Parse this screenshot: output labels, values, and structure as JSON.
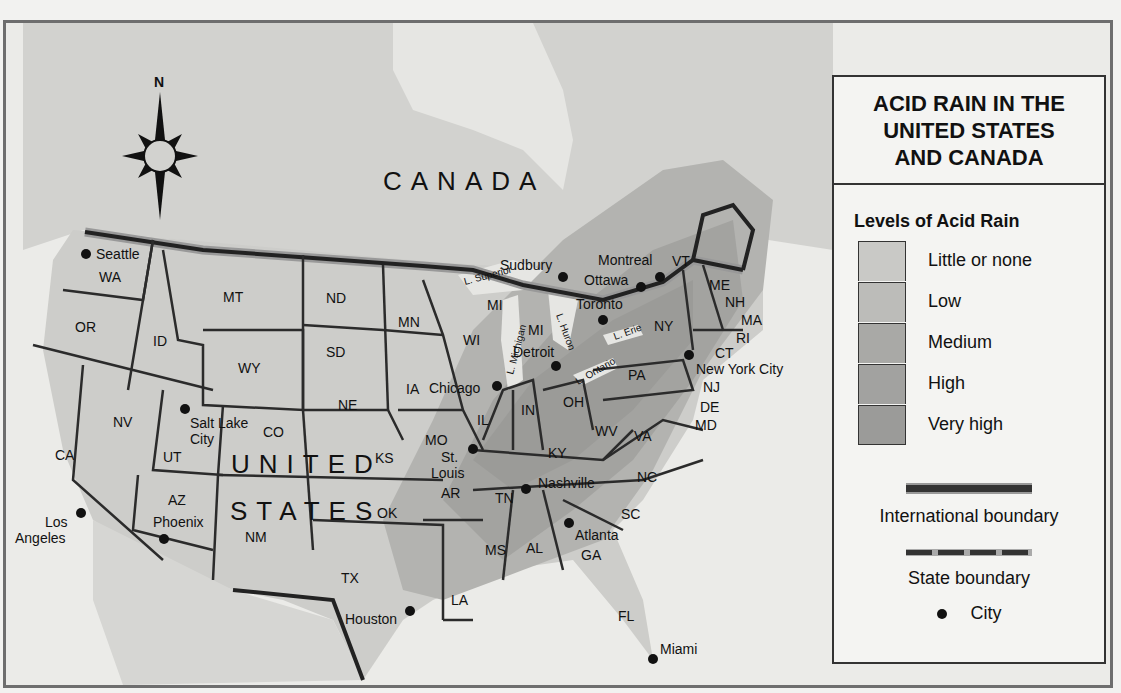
{
  "title": "ACID RAIN IN THE UNITED STATES AND CANADA",
  "title_lines": [
    "ACID RAIN IN THE",
    "UNITED STATES",
    "AND CANADA"
  ],
  "compass": {
    "north_label": "N"
  },
  "legend": {
    "heading": "Levels of Acid Rain",
    "levels": [
      {
        "label": "Little or none",
        "color": "#c9c9c6"
      },
      {
        "label": "Low",
        "color": "#bcbcb9"
      },
      {
        "label": "Medium",
        "color": "#a9a9a6"
      },
      {
        "label": "High",
        "color": "#a2a2a0"
      },
      {
        "label": "Very high",
        "color": "#9b9b99"
      }
    ],
    "international_boundary": "International boundary",
    "state_boundary": "State boundary",
    "city": "City"
  },
  "regions": {
    "canada": "CANADA",
    "united": "UNITED",
    "states": "STATES"
  },
  "lakes": [
    "L. Superior",
    "L. Michigan",
    "L. Huron",
    "L. Erie",
    "L. Ontario"
  ],
  "states": {
    "WA": "WA",
    "OR": "OR",
    "CA": "CA",
    "ID": "ID",
    "NV": "NV",
    "MT": "MT",
    "WY": "WY",
    "UT": "UT",
    "CO": "CO",
    "AZ": "AZ",
    "NM": "NM",
    "ND": "ND",
    "SD": "SD",
    "NE": "NE",
    "KS": "KS",
    "OK": "OK",
    "TX": "TX",
    "MN": "MN",
    "IA": "IA",
    "MO": "MO",
    "AR": "AR",
    "LA": "LA",
    "WI": "WI",
    "IL": "IL",
    "MI1": "MI",
    "MI2": "MI",
    "IN": "IN",
    "OH": "OH",
    "KY": "KY",
    "TN": "TN",
    "MS": "MS",
    "AL": "AL",
    "GA": "GA",
    "FL": "FL",
    "SC": "SC",
    "NC": "NC",
    "VA": "VA",
    "WV": "WV",
    "PA": "PA",
    "NY": "NY",
    "VT": "VT",
    "NH": "NH",
    "ME": "ME",
    "MA": "MA",
    "RI": "RI",
    "CT": "CT",
    "NJ": "NJ",
    "DE": "DE",
    "MD": "MD"
  },
  "cities": {
    "seattle": "Seattle",
    "salt_lake_1": "Salt Lake",
    "salt_lake_2": "City",
    "los_1": "Los",
    "los_2": "Angeles",
    "phoenix": "Phoenix",
    "houston": "Houston",
    "chicago": "Chicago",
    "st_louis_1": "St.",
    "st_louis_2": "Louis",
    "nashville": "Nashville",
    "atlanta": "Atlanta",
    "miami": "Miami",
    "detroit": "Detroit",
    "toronto": "Toronto",
    "sudbury": "Sudbury",
    "ottawa": "Ottawa",
    "montreal": "Montreal",
    "nyc": "New York City"
  }
}
